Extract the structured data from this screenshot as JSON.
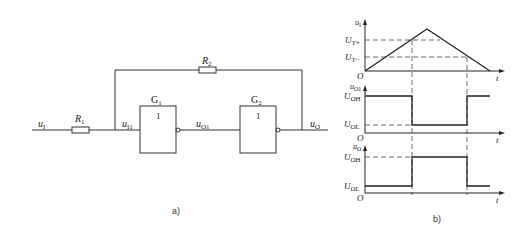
{
  "circuit": {
    "input_label": "u",
    "input_sub": "I",
    "r1_label": "R",
    "r1_sub": "1",
    "r2_label": "R",
    "r2_sub": "2",
    "node_i1_label": "u",
    "node_i1_sub": "I1",
    "g1_label": "G",
    "g1_sub": "1",
    "g1_func": "1",
    "g2_label": "G",
    "g2_sub": "2",
    "g2_func": "1",
    "node_o1_label": "u",
    "node_o1_sub": "O1",
    "output_label": "u",
    "output_sub": "O",
    "caption": "a)"
  },
  "waveforms": {
    "caption": "b)",
    "plot1": {
      "ylabel": "u",
      "ylabel_sub": "I",
      "level_high": "U",
      "level_high_sub": "T+",
      "level_low": "U",
      "level_low_sub": "T−",
      "origin": "O",
      "xlabel": "t"
    },
    "plot2": {
      "ylabel": "u",
      "ylabel_sub": "O1",
      "level_high": "U",
      "level_high_sub": "OH",
      "level_low": "U",
      "level_low_sub": "OL",
      "origin": "O",
      "xlabel": "t"
    },
    "plot3": {
      "ylabel": "u",
      "ylabel_sub": "O",
      "level_high": "U",
      "level_high_sub": "OH",
      "level_low": "U",
      "level_low_sub": "OL",
      "origin": "O",
      "xlabel": "t"
    }
  },
  "colors": {
    "line": "#222222",
    "dash": "#444444"
  }
}
